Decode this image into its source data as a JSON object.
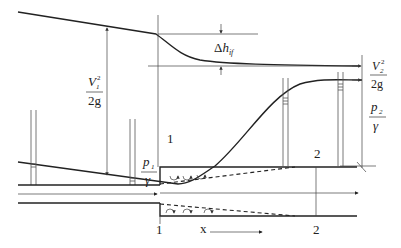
{
  "diagram": {
    "labels": {
      "v1_num": "V",
      "v1_sub": "1",
      "v1_sup": "2",
      "v1_den": "2g",
      "v2_num": "V",
      "v2_sub": "2",
      "v2_sup": "2",
      "v2_den": "2g",
      "p1_num": "p",
      "p1_sub": "1",
      "p1_den": "γ",
      "p2_num": "p",
      "p2_sub": "2",
      "p2_den": "γ",
      "dh_delta": "Δ",
      "dh_h": "h",
      "dh_sub": "if",
      "section1_top": "1",
      "section2_top": "2",
      "section1_bottom": "1",
      "section2_bottom": "2",
      "x_axis": "x"
    },
    "colors": {
      "line": "#222222",
      "background": "#ffffff"
    }
  }
}
